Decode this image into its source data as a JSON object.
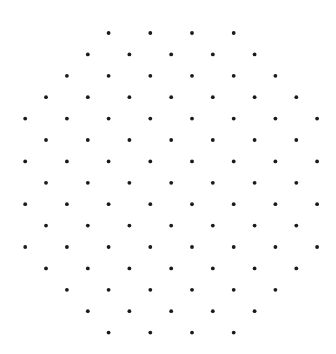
{
  "figure": {
    "dot_color": "#1a1a1a",
    "background_color": "#ffffff",
    "lattice": "triangular",
    "row_count": 15,
    "total_dots": 96,
    "rows": [
      {
        "row": 0,
        "columns": [
          4,
          6,
          8,
          10
        ]
      },
      {
        "row": 1,
        "columns": [
          3,
          5,
          7,
          9,
          11
        ]
      },
      {
        "row": 2,
        "columns": [
          2,
          4,
          6,
          8,
          10,
          12
        ]
      },
      {
        "row": 3,
        "columns": [
          1,
          3,
          5,
          7,
          9,
          11,
          13
        ]
      },
      {
        "row": 4,
        "columns": [
          0,
          2,
          4,
          6,
          8,
          10,
          12,
          14
        ]
      },
      {
        "row": 5,
        "columns": [
          1,
          3,
          5,
          7,
          9,
          11,
          13
        ]
      },
      {
        "row": 6,
        "columns": [
          0,
          2,
          4,
          6,
          8,
          10,
          12,
          14
        ]
      },
      {
        "row": 7,
        "columns": [
          1,
          3,
          5,
          7,
          9,
          11,
          13
        ]
      },
      {
        "row": 8,
        "columns": [
          0,
          2,
          4,
          6,
          8,
          10,
          12,
          14
        ]
      },
      {
        "row": 9,
        "columns": [
          1,
          3,
          5,
          7,
          9,
          11,
          13
        ]
      },
      {
        "row": 10,
        "columns": [
          0,
          2,
          4,
          6,
          8,
          10,
          12,
          14
        ]
      },
      {
        "row": 11,
        "columns": [
          1,
          3,
          5,
          7,
          9,
          11,
          13
        ]
      },
      {
        "row": 12,
        "columns": [
          2,
          4,
          6,
          8,
          10,
          12
        ]
      },
      {
        "row": 13,
        "columns": [
          3,
          5,
          7,
          9,
          11
        ]
      },
      {
        "row": 14,
        "columns": [
          4,
          6,
          8,
          10
        ]
      }
    ]
  }
}
